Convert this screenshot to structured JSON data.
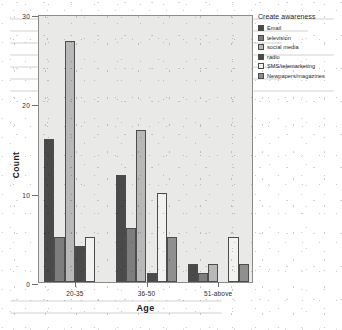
{
  "chart_data": {
    "type": "bar",
    "title": "",
    "xlabel": "Age",
    "ylabel": "Count",
    "categories": [
      "20-35",
      "36-50",
      "51-above"
    ],
    "ylim": [
      0,
      30
    ],
    "yticks": [
      0,
      10,
      20,
      30
    ],
    "ytick_labels": [
      "0",
      "10",
      "20",
      "30"
    ],
    "grid": false,
    "legend_title": "Create awareness",
    "legend_position": "right",
    "series": [
      {
        "name": "Email",
        "color": "#4a4a4a",
        "values": [
          16,
          12,
          2
        ]
      },
      {
        "name": "television",
        "color": "#7d7d7d",
        "values": [
          5,
          6,
          1
        ]
      },
      {
        "name": "social media",
        "color": "#b8b8b8",
        "values": [
          27,
          17,
          2
        ]
      },
      {
        "name": "radio",
        "color": "#4a4a4a",
        "values": [
          4,
          1,
          0
        ]
      },
      {
        "name": "SMS/telemarketing",
        "color": "#f2f2f0",
        "values": [
          5,
          10,
          5
        ]
      },
      {
        "name": "Newpapers/magazines",
        "color": "#8f8f8f",
        "values": [
          0,
          5,
          2
        ]
      }
    ]
  },
  "figure": {
    "plot_background": "#e9e9e7",
    "axis_color": "#6f6f6f",
    "page_background": "#ffffff"
  }
}
